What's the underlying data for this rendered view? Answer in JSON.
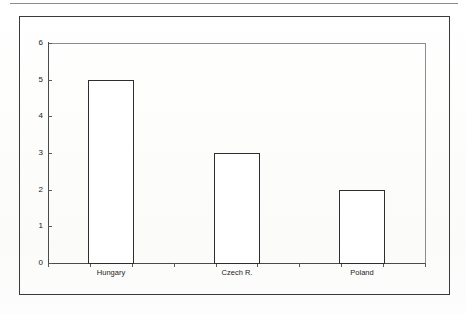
{
  "page": {
    "width": 466,
    "height": 314,
    "background_color": "#fefefe",
    "rule_color": "#8e8e90",
    "frame_color": "#3a3a3c"
  },
  "chart_data": {
    "type": "bar",
    "title": "",
    "subtitle": "",
    "xlabel": "",
    "ylabel": "",
    "categories": [
      "Hungary",
      "Czech R.",
      "Poland"
    ],
    "values": [
      5,
      3,
      2
    ],
    "series": [
      {
        "name": "",
        "values": [
          5,
          3,
          2
        ]
      }
    ],
    "ylim": [
      0,
      6
    ],
    "yticks": [
      0,
      1,
      2,
      3,
      4,
      5,
      6
    ],
    "ytick_labels": [
      "0",
      "1",
      "2",
      "3",
      "4",
      "5",
      "6"
    ],
    "grid": false,
    "legend": false,
    "legend_position": "none",
    "bar_fill_color": "#ffffff",
    "bar_border_color": "#2e2e30",
    "axis_color": "#4a4a4c",
    "plot_border_color": "#8c8c8e",
    "annotations": []
  },
  "axes": {
    "y_tick_0": "0",
    "y_tick_1": "1",
    "y_tick_2": "2",
    "y_tick_3": "3",
    "y_tick_4": "4",
    "y_tick_5": "5",
    "y_tick_6": "6"
  },
  "x_labels": {
    "label_0": "Hungary",
    "label_1": "Czech R.",
    "label_2": "Poland"
  }
}
